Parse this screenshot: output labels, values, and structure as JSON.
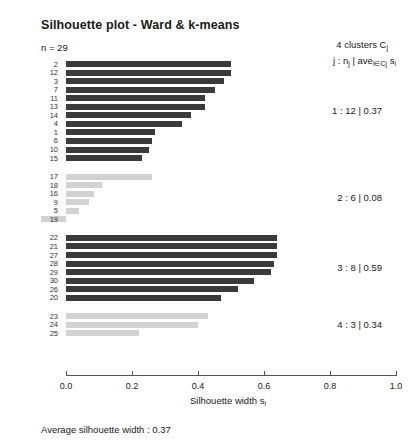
{
  "title": "Silhouette plot - Ward & k-means",
  "n_label": "n = 29",
  "legend": {
    "line1_prefix": "4  clusters  C",
    "line1_sub": "j",
    "line2_a": "j :  n",
    "line2_sub1": "j",
    "line2_b": " | ave",
    "line2_sub2": "i∈Cj",
    "line2_c": "  s",
    "line2_sub3": "i"
  },
  "axis": {
    "title_main": "Silhouette width s",
    "title_sub": "i",
    "ticks": [
      "0.0",
      "0.2",
      "0.4",
      "0.6",
      "0.8",
      "1.0"
    ],
    "tick_values": [
      0.0,
      0.2,
      0.4,
      0.6,
      0.8,
      1.0
    ],
    "xmin": 0.0,
    "xmax": 1.0
  },
  "footer": "Average silhouette width :  0.37",
  "colors": {
    "dark_bar": "#3a3a3a",
    "light_bar": "#d2d2d2",
    "axis": "#555555",
    "text": "#1a1a1a"
  },
  "chart_data": {
    "type": "bar",
    "orientation": "horizontal",
    "title": "Silhouette plot - Ward & k-means",
    "xlabel": "Silhouette width s_i",
    "ylabel": "",
    "xlim": [
      -0.1,
      1.0
    ],
    "grid": false,
    "legend_position": "right",
    "average_silhouette_width": 0.37,
    "n": 29,
    "n_clusters": 4,
    "clusters": [
      {
        "id": "1",
        "size": 12,
        "avg_silhouette": 0.37,
        "annotation": "1 :  12  |  0.37",
        "shade": "dark",
        "labels": [
          "2",
          "12",
          "3",
          "7",
          "11",
          "13",
          "14",
          "4",
          "1",
          "6",
          "10",
          "15"
        ],
        "values": [
          0.5,
          0.5,
          0.48,
          0.45,
          0.42,
          0.42,
          0.38,
          0.35,
          0.27,
          0.26,
          0.25,
          0.23
        ]
      },
      {
        "id": "2",
        "size": 6,
        "avg_silhouette": 0.08,
        "annotation": "2 :  6  |  0.08",
        "shade": "light",
        "labels": [
          "17",
          "18",
          "16",
          "9",
          "5",
          "19"
        ],
        "values": [
          0.26,
          0.11,
          0.085,
          0.07,
          0.04,
          -0.075
        ]
      },
      {
        "id": "3",
        "size": 8,
        "avg_silhouette": 0.59,
        "annotation": "3 :  8  |  0.59",
        "shade": "dark",
        "labels": [
          "22",
          "21",
          "27",
          "28",
          "29",
          "30",
          "26",
          "20"
        ],
        "values": [
          0.64,
          0.64,
          0.64,
          0.63,
          0.62,
          0.57,
          0.52,
          0.47
        ]
      },
      {
        "id": "4",
        "size": 3,
        "avg_silhouette": 0.34,
        "annotation": "4 :  3  |  0.34",
        "shade": "light",
        "labels": [
          "23",
          "24",
          "25"
        ],
        "values": [
          0.43,
          0.4,
          0.22
        ]
      }
    ]
  }
}
